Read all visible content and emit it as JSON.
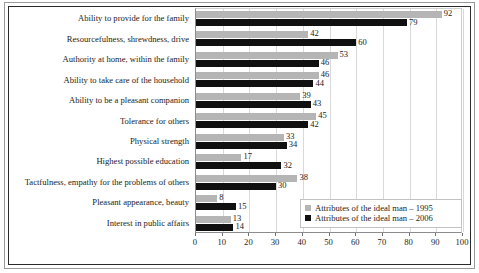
{
  "chart_data": {
    "type": "bar",
    "orientation": "horizontal",
    "title": "",
    "xlabel": "",
    "ylabel": "",
    "xlim": [
      0,
      100
    ],
    "xticks": [
      0,
      10,
      20,
      30,
      40,
      50,
      60,
      70,
      80,
      90,
      100
    ],
    "grid": "vertical",
    "legend_position": "bottom-right",
    "categories": [
      "Ability to provide for the family",
      "Resourcefulness, shrewdness, drive",
      "Authority at home, within the family",
      "Ability to take care of the household",
      "Ability to be a pleasant companion",
      "Tolerance for others",
      "Physical strength",
      "Highest possible education",
      "Tactfulness, empathy for the problems of others",
      "Pleasant appearance, beauty",
      "Interest in public affairs"
    ],
    "series": [
      {
        "name": "Attributes of the ideal man – 1995",
        "color": "#b5b5b5",
        "values": [
          92,
          42,
          53,
          46,
          39,
          45,
          33,
          17,
          38,
          8,
          13
        ]
      },
      {
        "name": "Attributes of the ideal man – 2006",
        "color": "#101010",
        "values": [
          79,
          60,
          46,
          44,
          43,
          42,
          34,
          32,
          30,
          15,
          14
        ]
      }
    ]
  }
}
